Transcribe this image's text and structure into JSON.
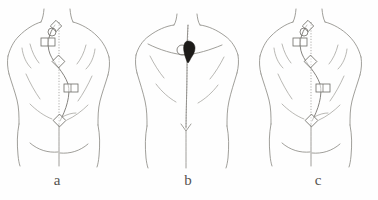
{
  "figure": {
    "caption_labels": [
      {
        "id": "a",
        "text": "a"
      },
      {
        "id": "b",
        "text": "b"
      },
      {
        "id": "c",
        "text": "c"
      }
    ],
    "background_color": "#fefefe",
    "line_color": "#888680",
    "marker_stroke_color": "#6d6b66",
    "blob_color": "#1d1b19",
    "panels": [
      {
        "id": "a",
        "label": "a",
        "description": "posterior trunk line drawing with plumb line and spinal markers",
        "plumb_line": {
          "visible": true,
          "style": "dotted"
        },
        "spine_curve": {
          "visible": true,
          "shape": "s-curve"
        },
        "markers": [
          {
            "type": "diamond",
            "position": "upper-thoracic",
            "x": 56,
            "y": 26
          },
          {
            "type": "circle",
            "position": "c7-vertebra",
            "x": 53,
            "y": 31
          },
          {
            "type": "rect",
            "position": "upper-left-scapular",
            "x": 48,
            "y": 42
          },
          {
            "type": "diamond",
            "position": "mid-thoracic-apex",
            "x": 58,
            "y": 61
          },
          {
            "type": "rect",
            "position": "lower-right-lumbar",
            "x": 71,
            "y": 88
          },
          {
            "type": "diamond",
            "position": "sacral-base",
            "x": 60,
            "y": 121
          }
        ]
      },
      {
        "id": "b",
        "label": "b",
        "description": "posterior trunk line drawing with straight spine line and dark applied marker",
        "plumb_line": {
          "visible": true,
          "style": "dotted"
        },
        "spine_curve": {
          "visible": false,
          "shape": "straight"
        },
        "markers": [
          {
            "type": "blob",
            "position": "upper-thoracic-device",
            "x": 64,
            "y": 50
          },
          {
            "type": "circle",
            "position": "adjacent-landmark",
            "x": 57,
            "y": 50
          },
          {
            "type": "arrow",
            "position": "lumbosacral",
            "x": 60,
            "y": 130
          }
        ]
      },
      {
        "id": "c",
        "label": "c",
        "description": "posterior trunk line drawing with plumb line and spinal markers",
        "plumb_line": {
          "visible": true,
          "style": "dotted"
        },
        "spine_curve": {
          "visible": true,
          "shape": "s-curve"
        },
        "markers": [
          {
            "type": "diamond",
            "position": "upper-thoracic",
            "x": 56,
            "y": 26
          },
          {
            "type": "circle",
            "position": "c7-vertebra",
            "x": 53,
            "y": 31
          },
          {
            "type": "rect",
            "position": "upper-left-scapular",
            "x": 48,
            "y": 42
          },
          {
            "type": "diamond",
            "position": "mid-thoracic-apex",
            "x": 58,
            "y": 61
          },
          {
            "type": "rect",
            "position": "lower-right-lumbar",
            "x": 71,
            "y": 88
          },
          {
            "type": "diamond",
            "position": "sacral-base",
            "x": 60,
            "y": 121
          }
        ]
      }
    ]
  }
}
